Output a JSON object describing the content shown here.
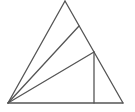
{
  "diagram": {
    "type": "geometry",
    "stroke_color": "#555555",
    "background": "#ffffff",
    "points": {
      "A": [
        65,
        1
      ],
      "B": [
        8,
        103
      ],
      "C": [
        123,
        103
      ],
      "D": [
        79,
        26
      ],
      "E": [
        94,
        52
      ],
      "F": [
        94,
        103
      ]
    },
    "segments": [
      {
        "name": "side-AB",
        "from": "A",
        "to": "B"
      },
      {
        "name": "side-AC",
        "from": "A",
        "to": "C"
      },
      {
        "name": "side-BC",
        "from": "B",
        "to": "C"
      },
      {
        "name": "segment-BD",
        "from": "B",
        "to": "D"
      },
      {
        "name": "segment-BE",
        "from": "B",
        "to": "E"
      },
      {
        "name": "segment-EF",
        "from": "E",
        "to": "F"
      }
    ]
  }
}
